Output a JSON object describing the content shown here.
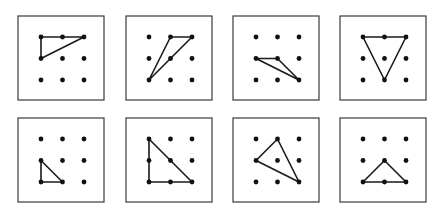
{
  "figure": {
    "grid": {
      "cols": 3,
      "rows": 3
    },
    "panels": [
      {
        "id": 1,
        "row": 0,
        "col": 0,
        "triangle": [
          [
            0,
            0
          ],
          [
            2,
            0
          ],
          [
            0,
            1
          ]
        ]
      },
      {
        "id": 2,
        "row": 0,
        "col": 1,
        "triangle": [
          [
            1,
            0
          ],
          [
            2,
            0
          ],
          [
            0,
            2
          ]
        ]
      },
      {
        "id": 3,
        "row": 0,
        "col": 2,
        "triangle": [
          [
            0,
            1
          ],
          [
            1,
            1
          ],
          [
            2,
            2
          ]
        ]
      },
      {
        "id": 4,
        "row": 0,
        "col": 3,
        "triangle": [
          [
            0,
            0
          ],
          [
            2,
            0
          ],
          [
            1,
            2
          ]
        ]
      },
      {
        "id": 5,
        "row": 1,
        "col": 0,
        "triangle": [
          [
            0,
            1
          ],
          [
            0,
            2
          ],
          [
            1,
            2
          ]
        ]
      },
      {
        "id": 6,
        "row": 1,
        "col": 1,
        "triangle": [
          [
            0,
            0
          ],
          [
            0,
            2
          ],
          [
            2,
            2
          ]
        ]
      },
      {
        "id": 7,
        "row": 1,
        "col": 2,
        "triangle": [
          [
            0,
            1
          ],
          [
            1,
            0
          ],
          [
            2,
            2
          ]
        ]
      },
      {
        "id": 8,
        "row": 1,
        "col": 3,
        "triangle": [
          [
            1,
            1
          ],
          [
            0,
            2
          ],
          [
            2,
            2
          ]
        ]
      }
    ],
    "colors": {
      "frame": "#3a3a3a",
      "line": "#1a1a1a",
      "dot": "#111111",
      "background": "#ffffff"
    }
  }
}
